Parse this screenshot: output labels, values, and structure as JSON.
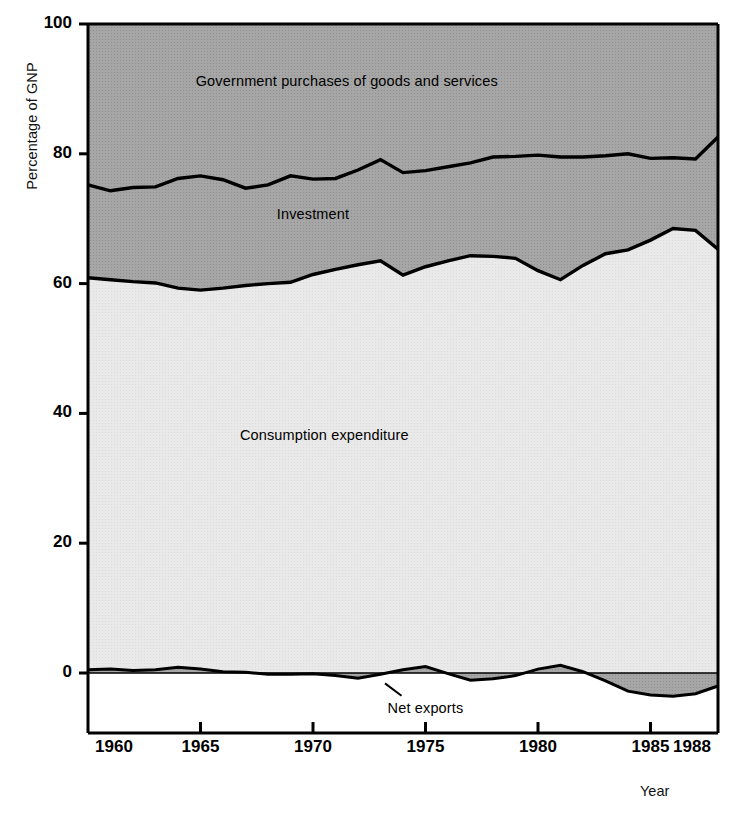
{
  "chart_data": {
    "type": "area",
    "title": "",
    "subtitle": "",
    "xlabel": "Year",
    "ylabel": "Percentage of GNP",
    "xlim": [
      1960,
      1988
    ],
    "ylim": [
      -8,
      100
    ],
    "grid": false,
    "legend_position": "inline-annotations",
    "stacked": true,
    "xticks": [
      1960,
      1965,
      1970,
      1975,
      1980,
      1985,
      1988
    ],
    "xtick_labels": [
      "1960",
      "1965",
      "1970",
      "1975",
      "1980",
      "1985",
      "1988"
    ],
    "yticks": [
      0,
      20,
      40,
      60,
      80,
      100
    ],
    "ytick_labels": [
      "0",
      "20",
      "40",
      "60",
      "80",
      "100"
    ],
    "annotations": [
      {
        "text": "Government purchases of goods and services",
        "x": 1971.5,
        "y": 91
      },
      {
        "text": "Investment",
        "x": 1970.0,
        "y": 70.5
      },
      {
        "text": "Consumption expenditure",
        "x": 1970.5,
        "y": 36.5
      },
      {
        "text": "Net exports",
        "x": 1975.0,
        "y": -5.5
      }
    ],
    "x": [
      1960,
      1961,
      1962,
      1963,
      1964,
      1965,
      1966,
      1967,
      1968,
      1969,
      1970,
      1971,
      1972,
      1973,
      1974,
      1975,
      1976,
      1977,
      1978,
      1979,
      1980,
      1981,
      1982,
      1983,
      1984,
      1985,
      1986,
      1987,
      1988
    ],
    "series": [
      {
        "name": "Consumption expenditure",
        "color": "#e8e8e8",
        "values": [
          60.9,
          60.6,
          60.3,
          60.1,
          59.3,
          59.0,
          59.3,
          59.7,
          60.0,
          60.2,
          61.4,
          62.2,
          62.9,
          63.5,
          61.3,
          62.6,
          63.5,
          64.3,
          64.2,
          63.9,
          62.0,
          60.6,
          62.8,
          64.6,
          65.2,
          66.7,
          68.5,
          68.2,
          65.3
        ]
      },
      {
        "name": "Investment",
        "color": "#a9a9a9",
        "values": [
          14.3,
          13.7,
          14.5,
          14.8,
          16.9,
          17.6,
          16.7,
          15.0,
          15.2,
          16.4,
          14.7,
          14.0,
          14.6,
          15.6,
          15.8,
          14.8,
          14.5,
          14.3,
          15.3,
          15.7,
          17.8,
          18.9,
          16.7,
          15.1,
          14.8,
          12.6,
          10.9,
          11.0,
          17.3
        ]
      },
      {
        "name": "Government purchases of goods and services",
        "color": "#9f9f9f",
        "values": [
          24.8,
          25.7,
          25.2,
          25.1,
          23.8,
          23.4,
          24.0,
          25.3,
          24.8,
          23.4,
          23.9,
          23.8,
          22.5,
          20.9,
          22.9,
          22.6,
          22.0,
          21.4,
          20.5,
          20.4,
          20.2,
          20.5,
          20.5,
          20.3,
          20.0,
          20.7,
          20.6,
          20.8,
          17.4
        ]
      },
      {
        "name": "Net exports",
        "color": "#a9a9a9",
        "values": [
          0.5,
          0.6,
          0.4,
          0.5,
          0.9,
          0.6,
          0.2,
          0.1,
          -0.2,
          -0.2,
          -0.1,
          -0.4,
          -0.8,
          -0.2,
          0.5,
          1.0,
          -0.1,
          -1.1,
          -0.9,
          -0.4,
          0.6,
          1.2,
          0.2,
          -1.2,
          -2.8,
          -3.4,
          -3.6,
          -3.2,
          -2.0
        ]
      }
    ]
  },
  "axes": {
    "ylabel": "Percentage of GNP",
    "xlabel": "Year"
  }
}
